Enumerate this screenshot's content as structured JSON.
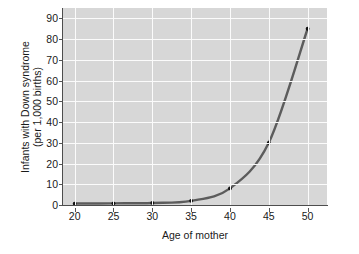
{
  "chart_data": {
    "type": "line",
    "title": "",
    "subtitle": "",
    "xlabel": "Age of mother",
    "ylabel": "Infants with Down syndrome (per 1,000 births)",
    "ylabel_lines": [
      "Infants with Down syndrome",
      "(per 1,000 births)"
    ],
    "x": [
      20,
      25,
      30,
      35,
      40,
      45,
      50
    ],
    "values": [
      0.7,
      0.8,
      1.0,
      2.0,
      8.0,
      30.0,
      85.0
    ],
    "series": [
      {
        "name": "Down syndrome incidence",
        "values": [
          0.7,
          0.8,
          1.0,
          2.0,
          8.0,
          30.0,
          85.0
        ],
        "color": "#5c5c5c",
        "marker": "circle",
        "marker_color": "#111111"
      }
    ],
    "xlim": [
      18.5,
      52.5
    ],
    "ylim": [
      0,
      95
    ],
    "xticks": [
      20,
      25,
      30,
      35,
      40,
      45,
      50
    ],
    "yticks": [
      0,
      10,
      20,
      30,
      40,
      50,
      60,
      70,
      80,
      90
    ],
    "xtick_labels": [
      "20",
      "25",
      "30",
      "35",
      "40",
      "45",
      "50"
    ],
    "ytick_labels": [
      "0",
      "10",
      "20",
      "30",
      "40",
      "50",
      "60",
      "70",
      "80",
      "90"
    ],
    "grid": true,
    "grid_color": "#fbfbfb",
    "plot_background": "#d7d7d7",
    "figure_background": "#ffffff",
    "axis_color": "#4d4d4d",
    "legend": null,
    "legend_position": "none",
    "annotations": []
  }
}
